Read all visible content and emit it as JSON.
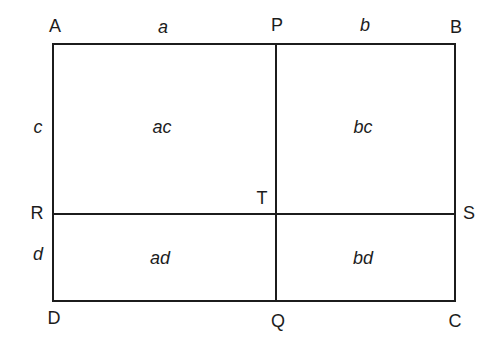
{
  "diagram": {
    "type": "rectangle-partition",
    "colors": {
      "background": "#ffffff",
      "line": "#1c1c1c",
      "text": "#1c1c1c"
    },
    "vertex_labels": {
      "top_left": "A",
      "top_middle": "P",
      "top_right": "B",
      "left_middle": "R",
      "center": "T",
      "right_middle": "S",
      "bottom_left": "D",
      "bottom_middle": "Q",
      "bottom_right": "C"
    },
    "segment_labels": {
      "top_left": "a",
      "top_right": "b",
      "left_upper": "c",
      "left_lower": "d"
    },
    "region_labels": {
      "upper_left": "ac",
      "upper_right": "bc",
      "lower_left": "ad",
      "lower_right": "bd"
    }
  }
}
